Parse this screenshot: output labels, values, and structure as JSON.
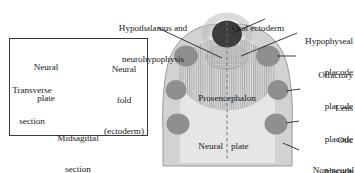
{
  "figure": {
    "colors": {
      "outline": "#8d8d8d",
      "non_neural_ectoderm": "#d3d3d3",
      "neural_plate": "#e3e3e3",
      "prosencephalon": "#c9c9c9",
      "placode": "#8f8f8f",
      "oral_ectoderm": "#3d3d3d",
      "hypophyseal_placode": "#7a7a7a",
      "midline_dash": "#6e6e6e",
      "leader_line": "#1a1a1a",
      "text": "#1a1a1a",
      "inset_border": "#3a3a3a",
      "embryo_body": "#b8b8b8"
    }
  },
  "inset": {
    "name": "inset-panel-embryo-orientation",
    "labels": {
      "neural_plate_line1": "Neural",
      "neural_plate_line2": "plate",
      "neural_fold_line1": "Neural",
      "neural_fold_line2": "fold",
      "neural_fold_line3": "(ectoderm)",
      "transverse_line1": "Transverse",
      "transverse_line2": "section",
      "midsagittal_line1": "Midsagittal",
      "midsagittal_line2": "section"
    }
  },
  "main": {
    "name": "main-diagram-neural-plate",
    "labels": {
      "hypothalamus_line1": "Hypothalamus and",
      "hypothalamus_line2": "neurohypophysis",
      "oral_ectoderm": "Oral ectoderm",
      "hypophyseal_line1": "Hypophyseal",
      "hypophyseal_line2": "placode",
      "olfactory_line1": "Olfactory",
      "olfactory_line2": "placode",
      "lens_line1": "Lens",
      "lens_line2": "placode",
      "otic_line1": "Otic",
      "otic_line2": "placode",
      "nonneural_line1": "Non-neural",
      "nonneural_line2": "ectoderm",
      "prosencephalon": "Prosencephalon",
      "neural_plate_left": "Neural",
      "neural_plate_right": "plate",
      "midline": "midline"
    }
  }
}
